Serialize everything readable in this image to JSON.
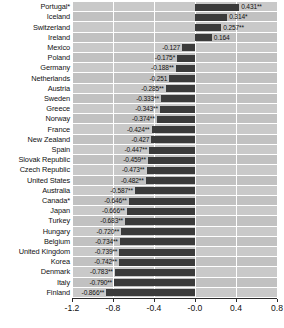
{
  "chart_data": {
    "type": "bar",
    "orientation": "horizontal",
    "title": "",
    "subtitle": "",
    "xlabel": "",
    "ylabel": "",
    "xlim": [
      -1.2,
      0.8
    ],
    "xticks": [
      -1.2,
      -0.8,
      -0.4,
      -0.0,
      0.4,
      0.8
    ],
    "xtick_labels": [
      "-1.2",
      "-0.8",
      "-0.4",
      "-0.0",
      "0.4",
      "0.8"
    ],
    "grid": true,
    "legend": "none",
    "bar_color": "#3b3b3b",
    "plot_background": "#c9c9c9",
    "categories": [
      "Portugal*",
      "Iceland",
      "Switzerland",
      "Ireland",
      "Mexico",
      "Poland",
      "Germany",
      "Netherlands",
      "Austria",
      "Sweden",
      "Greece",
      "Norway",
      "France",
      "New Zealand",
      "Spain",
      "Slovak Republic",
      "Czech Republic",
      "United States",
      "Australia",
      "Canada*",
      "Japan",
      "Turkey",
      "Hungary",
      "Belgium",
      "United Kingdom",
      "Korea",
      "Denmark",
      "Italy",
      "Finland"
    ],
    "values": [
      0.431,
      0.314,
      0.257,
      0.164,
      -0.127,
      -0.175,
      -0.188,
      -0.251,
      -0.285,
      -0.333,
      -0.343,
      -0.374,
      -0.424,
      -0.427,
      -0.447,
      -0.459,
      -0.473,
      -0.482,
      -0.587,
      -0.646,
      -0.666,
      -0.683,
      -0.72,
      -0.734,
      -0.739,
      -0.742,
      -0.783,
      -0.79,
      -0.866
    ],
    "value_labels": [
      "0.431**",
      "0.314*",
      "0.257**",
      "0.164",
      "-0.127",
      "-0.175*",
      "-0.188**",
      "-0.251",
      "-0.285**",
      "-0.333**",
      "-0.343**",
      "-0.374**",
      "-0.424**",
      "-0.427",
      "-0.447**",
      "-0.459**",
      "-0.473**",
      "-0.482**",
      "-0.587**",
      "-0.646**",
      "-0.666**",
      "-0.683**",
      "-0.720**",
      "-0.734**",
      "-0.739**",
      "-0.742**",
      "-0.783**",
      "-0.790**",
      "-0.866**"
    ]
  }
}
